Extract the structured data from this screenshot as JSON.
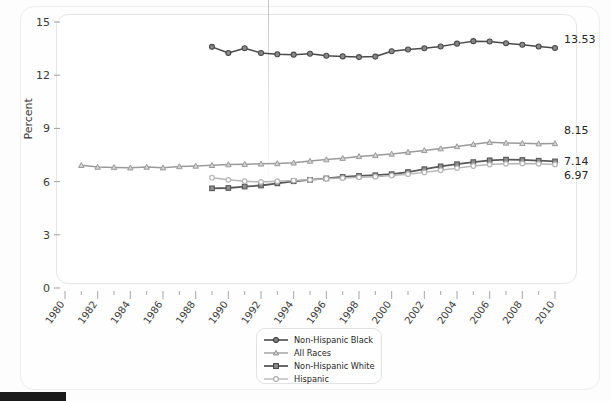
{
  "chart_data": {
    "type": "line",
    "title": "",
    "xlabel": "",
    "ylabel": "Percent",
    "xlim": [
      1980,
      2010
    ],
    "ylim": [
      0,
      15
    ],
    "yticks": [
      0,
      3,
      6,
      9,
      12,
      15
    ],
    "xticks": [
      1980,
      1982,
      1984,
      1986,
      1988,
      1990,
      1992,
      1994,
      1996,
      1998,
      2000,
      2002,
      2004,
      2006,
      2008,
      2010
    ],
    "grid": false,
    "legend_position": "bottom-center",
    "series": [
      {
        "name": "Non-Hispanic Black",
        "color": "#4a4a4a",
        "marker": "circle",
        "end_label": "13.53",
        "x": [
          1989,
          1990,
          1991,
          1992,
          1993,
          1994,
          1995,
          1996,
          1997,
          1998,
          1999,
          2000,
          2001,
          2002,
          2003,
          2004,
          2005,
          2006,
          2007,
          2008,
          2009,
          2010
        ],
        "values": [
          13.6,
          13.25,
          13.52,
          13.25,
          13.18,
          13.16,
          13.21,
          13.1,
          13.06,
          13.02,
          13.05,
          13.35,
          13.45,
          13.52,
          13.62,
          13.78,
          13.92,
          13.9,
          13.8,
          13.72,
          13.62,
          13.53
        ]
      },
      {
        "name": "All Races",
        "color": "#9a9a9a",
        "marker": "triangle",
        "end_label": "8.15",
        "x": [
          1981,
          1982,
          1983,
          1984,
          1985,
          1986,
          1987,
          1988,
          1989,
          1990,
          1991,
          1992,
          1993,
          1994,
          1995,
          1996,
          1997,
          1998,
          1999,
          2000,
          2001,
          2002,
          2003,
          2004,
          2005,
          2006,
          2007,
          2008,
          2009,
          2010
        ],
        "values": [
          6.92,
          6.82,
          6.8,
          6.78,
          6.82,
          6.78,
          6.85,
          6.88,
          6.92,
          6.96,
          6.98,
          7.0,
          7.02,
          7.06,
          7.16,
          7.24,
          7.32,
          7.42,
          7.48,
          7.56,
          7.66,
          7.76,
          7.86,
          7.98,
          8.1,
          8.22,
          8.18,
          8.16,
          8.14,
          8.15
        ]
      },
      {
        "name": "Non-Hispanic White",
        "color": "#585858",
        "marker": "square",
        "end_label": "7.14",
        "x": [
          1989,
          1990,
          1991,
          1992,
          1993,
          1994,
          1995,
          1996,
          1997,
          1998,
          1999,
          2000,
          2001,
          2002,
          2003,
          2004,
          2005,
          2006,
          2007,
          2008,
          2009,
          2010
        ],
        "values": [
          5.62,
          5.64,
          5.72,
          5.78,
          5.9,
          6.02,
          6.1,
          6.18,
          6.26,
          6.32,
          6.36,
          6.42,
          6.54,
          6.7,
          6.86,
          6.98,
          7.1,
          7.2,
          7.24,
          7.22,
          7.18,
          7.14
        ]
      },
      {
        "name": "Hispanic",
        "color": "#b6b6b6",
        "marker": "circle-open",
        "end_label": "6.97",
        "x": [
          1989,
          1990,
          1991,
          1992,
          1993,
          1994,
          1995,
          1996,
          1997,
          1998,
          1999,
          2000,
          2001,
          2002,
          2003,
          2004,
          2005,
          2006,
          2007,
          2008,
          2009,
          2010
        ],
        "values": [
          6.22,
          6.1,
          6.02,
          5.98,
          6.02,
          6.06,
          6.1,
          6.16,
          6.2,
          6.24,
          6.28,
          6.34,
          6.42,
          6.52,
          6.64,
          6.76,
          6.88,
          6.96,
          7.0,
          7.02,
          7.0,
          6.97
        ]
      }
    ]
  },
  "legend": {
    "items": [
      {
        "label": "Non-Hispanic Black"
      },
      {
        "label": "All Races"
      },
      {
        "label": "Non-Hispanic White"
      },
      {
        "label": "Hispanic"
      }
    ]
  }
}
